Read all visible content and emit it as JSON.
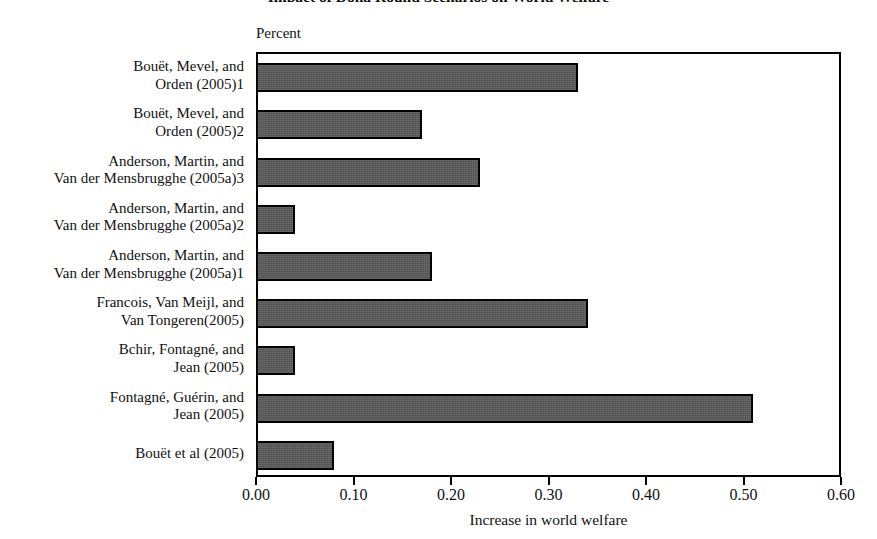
{
  "figure": {
    "title_fragment": "Impact of Doha Round Scenarios on World Welfare",
    "percent_caption": "Percent"
  },
  "chart_data": {
    "type": "bar",
    "orientation": "horizontal",
    "title": "",
    "xlabel": "Increase in world welfare",
    "ylabel": "",
    "unit_caption": "Percent",
    "xlim": [
      0.0,
      0.6
    ],
    "xticks": [
      0.0,
      0.1,
      0.2,
      0.3,
      0.4,
      0.5,
      0.6
    ],
    "xticklabels": [
      "0.00",
      "0.10",
      "0.20",
      "0.30",
      "0.40",
      "0.50",
      "0.60"
    ],
    "grid": false,
    "legend": null,
    "bar_color": "#575757",
    "bar_edge_color": "#000000",
    "categories": [
      "Bouët, Mevel, and Orden (2005)1",
      "Bouët, Mevel, and Orden (2005)2",
      "Anderson, Martin, and Van der Mensbrugghe (2005a)3",
      "Anderson, Martin, and Van der Mensbrugghe (2005a)2",
      "Anderson, Martin, and Van der Mensbrugghe (2005a)1",
      "Francois, Van Meijl, and Van Tongeren(2005)",
      "Bchir, Fontagné, and Jean (2005)",
      "Fontagné, Guérin, and Jean (2005)",
      "Bouët et al (2005)"
    ],
    "category_lines": [
      [
        "Bouët, Mevel, and",
        "Orden (2005)1"
      ],
      [
        "Bouët, Mevel, and",
        "Orden (2005)2"
      ],
      [
        "Anderson, Martin, and",
        "Van der Mensbrugghe (2005a)3"
      ],
      [
        "Anderson, Martin, and",
        "Van der Mensbrugghe (2005a)2"
      ],
      [
        "Anderson, Martin, and",
        "Van der Mensbrugghe (2005a)1"
      ],
      [
        "Francois, Van Meijl, and",
        "Van Tongeren(2005)"
      ],
      [
        "Bchir, Fontagné, and",
        "Jean (2005)"
      ],
      [
        "Fontagné, Guérin, and",
        "Jean (2005)"
      ],
      [
        "Bouët et al (2005)",
        ""
      ]
    ],
    "values": [
      0.33,
      0.17,
      0.23,
      0.04,
      0.18,
      0.34,
      0.04,
      0.51,
      0.08
    ]
  }
}
